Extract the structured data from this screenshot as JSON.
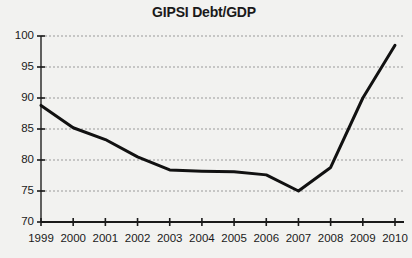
{
  "chart_data": {
    "type": "line",
    "title": "GIPSI Debt/GDP",
    "xlabel": "",
    "ylabel": "",
    "x": [
      1999,
      2000,
      2001,
      2002,
      2003,
      2004,
      2005,
      2006,
      2007,
      2008,
      2009,
      2010
    ],
    "categories": [
      "1999",
      "2000",
      "2001",
      "2002",
      "2003",
      "2004",
      "2005",
      "2006",
      "2007",
      "2008",
      "2009",
      "2010"
    ],
    "values": [
      88.8,
      85.2,
      83.3,
      80.5,
      78.4,
      78.2,
      78.1,
      77.6,
      75.0,
      78.8,
      90.0,
      98.5
    ],
    "series": [
      {
        "name": "GIPSI Debt/GDP",
        "values": [
          88.8,
          85.2,
          83.3,
          80.5,
          78.4,
          78.2,
          78.1,
          77.6,
          75.0,
          78.8,
          90.0,
          98.5
        ]
      }
    ],
    "ylim": [
      70,
      100
    ],
    "yticks": [
      70,
      75,
      80,
      85,
      90,
      95,
      100
    ],
    "ytick_labels": [
      "70",
      "75",
      "80",
      "85",
      "90",
      "95",
      "100"
    ],
    "xlim": [
      1999,
      2010
    ],
    "grid": "horizontal-dotted",
    "legend": "none",
    "line_color": "#111111",
    "line_width": 3,
    "axis_color": "#3a3a3a",
    "grid_color": "#9a9a9a",
    "background_color": "#f2f2f0"
  }
}
